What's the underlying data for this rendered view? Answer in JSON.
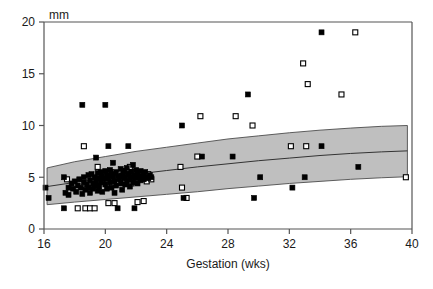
{
  "chart_data": {
    "type": "scatter",
    "title": "",
    "xlabel": "Gestation (wks)",
    "ylabel": "mm",
    "unit_label": "mm",
    "xlim": [
      16,
      40
    ],
    "ylim": [
      0,
      20
    ],
    "xticks": [
      16,
      20,
      24,
      28,
      32,
      36,
      40
    ],
    "yticks": [
      0,
      5,
      10,
      15,
      20
    ],
    "grid": false,
    "legend": "none",
    "colors": {
      "filled_marker": "#000000",
      "open_marker_fill": "#ffffff",
      "open_marker_edge": "#000000",
      "band_fill": "#bfbfbf",
      "band_edge": "#4d4d4d",
      "center_line": "#333333",
      "axis": "#555555",
      "text": "#1a1a1a"
    },
    "reference_band": {
      "description": "Shaded normal reference range with central median line",
      "x": [
        16.2,
        18,
        20,
        22,
        24,
        26,
        28,
        30,
        32,
        34,
        36,
        38,
        39.7
      ],
      "upper": [
        5.9,
        6.5,
        7.0,
        7.5,
        7.9,
        8.3,
        8.7,
        9.0,
        9.3,
        9.55,
        9.75,
        9.92,
        10.0
      ],
      "median": [
        4.1,
        4.5,
        4.9,
        5.3,
        5.65,
        6.0,
        6.3,
        6.6,
        6.85,
        7.1,
        7.3,
        7.45,
        7.55
      ],
      "lower": [
        2.35,
        2.6,
        2.85,
        3.1,
        3.35,
        3.6,
        3.9,
        4.15,
        4.4,
        4.6,
        4.8,
        4.95,
        5.05
      ]
    },
    "series": [
      {
        "name": "filled-squares",
        "marker": "filled-square",
        "points": [
          [
            16.1,
            4.0
          ],
          [
            16.3,
            3.0
          ],
          [
            17.3,
            2.0
          ],
          [
            17.3,
            5.0
          ],
          [
            17.4,
            3.5
          ],
          [
            17.6,
            4.0
          ],
          [
            17.6,
            3.3
          ],
          [
            17.8,
            4.4
          ],
          [
            17.9,
            3.9
          ],
          [
            18.0,
            4.6
          ],
          [
            18.1,
            3.6
          ],
          [
            18.2,
            4.2
          ],
          [
            18.3,
            4.8
          ],
          [
            18.4,
            4.0
          ],
          [
            18.5,
            12.0
          ],
          [
            18.5,
            3.4
          ],
          [
            18.6,
            4.5
          ],
          [
            18.6,
            5.0
          ],
          [
            18.7,
            3.8
          ],
          [
            18.8,
            4.3
          ],
          [
            18.9,
            5.2
          ],
          [
            18.9,
            4.0
          ],
          [
            19.0,
            4.7
          ],
          [
            19.0,
            3.5
          ],
          [
            19.1,
            5.3
          ],
          [
            19.2,
            4.4
          ],
          [
            19.2,
            3.9
          ],
          [
            19.3,
            5.0
          ],
          [
            19.3,
            4.2
          ],
          [
            19.4,
            6.9
          ],
          [
            19.4,
            4.6
          ],
          [
            19.5,
            5.4
          ],
          [
            19.5,
            3.7
          ],
          [
            19.6,
            4.9
          ],
          [
            19.6,
            4.1
          ],
          [
            19.7,
            5.5
          ],
          [
            19.7,
            4.5
          ],
          [
            19.8,
            5.1
          ],
          [
            19.8,
            3.6
          ],
          [
            19.9,
            4.8
          ],
          [
            20.0,
            12.0
          ],
          [
            20.0,
            5.6
          ],
          [
            20.0,
            4.3
          ],
          [
            20.1,
            5.2
          ],
          [
            20.1,
            3.9
          ],
          [
            20.2,
            8.0
          ],
          [
            20.2,
            4.9
          ],
          [
            20.3,
            5.7
          ],
          [
            20.3,
            4.5
          ],
          [
            20.4,
            5.3
          ],
          [
            20.4,
            4.0
          ],
          [
            20.5,
            6.4
          ],
          [
            20.5,
            5.0
          ],
          [
            20.6,
            4.6
          ],
          [
            20.6,
            3.5
          ],
          [
            20.7,
            5.5
          ],
          [
            20.7,
            4.2
          ],
          [
            20.8,
            5.1
          ],
          [
            20.8,
            2.0
          ],
          [
            20.9,
            4.8
          ],
          [
            21.0,
            5.8
          ],
          [
            21.0,
            4.4
          ],
          [
            21.1,
            5.2
          ],
          [
            21.1,
            3.8
          ],
          [
            21.2,
            5.6
          ],
          [
            21.2,
            4.9
          ],
          [
            21.3,
            5.0
          ],
          [
            21.3,
            4.3
          ],
          [
            21.4,
            5.9
          ],
          [
            21.4,
            4.6
          ],
          [
            21.5,
            8.0
          ],
          [
            21.5,
            5.3
          ],
          [
            21.6,
            4.8
          ],
          [
            21.6,
            4.1
          ],
          [
            21.7,
            5.5
          ],
          [
            21.7,
            5.0
          ],
          [
            21.8,
            6.2
          ],
          [
            21.8,
            4.5
          ],
          [
            21.9,
            5.2
          ],
          [
            21.9,
            2.0
          ],
          [
            22.0,
            5.7
          ],
          [
            22.0,
            4.9
          ],
          [
            22.1,
            5.4
          ],
          [
            22.1,
            4.4
          ],
          [
            22.2,
            5.0
          ],
          [
            22.3,
            5.6
          ],
          [
            22.3,
            4.7
          ],
          [
            22.4,
            5.1
          ],
          [
            22.5,
            5.3
          ],
          [
            22.5,
            4.8
          ],
          [
            22.6,
            5.5
          ],
          [
            22.7,
            5.0
          ],
          [
            22.8,
            4.9
          ],
          [
            22.9,
            5.2
          ],
          [
            23.0,
            5.0
          ],
          [
            25.0,
            10.0
          ],
          [
            25.1,
            3.0
          ],
          [
            26.3,
            7.0
          ],
          [
            28.3,
            7.0
          ],
          [
            29.3,
            13.0
          ],
          [
            29.7,
            3.0
          ],
          [
            30.1,
            5.0
          ],
          [
            32.2,
            4.0
          ],
          [
            33.0,
            5.0
          ],
          [
            34.1,
            19.0
          ],
          [
            34.1,
            8.0
          ],
          [
            36.5,
            6.0
          ]
        ]
      },
      {
        "name": "open-squares",
        "marker": "open-square",
        "points": [
          [
            17.5,
            4.8
          ],
          [
            18.2,
            2.0
          ],
          [
            18.6,
            8.0
          ],
          [
            18.7,
            2.0
          ],
          [
            19.0,
            2.0
          ],
          [
            19.3,
            2.0
          ],
          [
            19.5,
            6.0
          ],
          [
            19.6,
            4.6
          ],
          [
            19.8,
            5.0
          ],
          [
            20.0,
            5.3
          ],
          [
            20.1,
            4.4
          ],
          [
            20.2,
            2.5
          ],
          [
            20.3,
            5.5
          ],
          [
            20.4,
            4.8
          ],
          [
            20.5,
            5.2
          ],
          [
            20.6,
            2.5
          ],
          [
            20.7,
            5.0
          ],
          [
            20.8,
            4.5
          ],
          [
            20.9,
            5.4
          ],
          [
            21.0,
            4.9
          ],
          [
            21.1,
            5.1
          ],
          [
            21.2,
            5.6
          ],
          [
            21.3,
            4.7
          ],
          [
            21.4,
            5.0
          ],
          [
            21.5,
            5.3
          ],
          [
            21.6,
            6.0
          ],
          [
            21.7,
            4.4
          ],
          [
            21.8,
            5.2
          ],
          [
            21.9,
            5.5
          ],
          [
            22.0,
            4.8
          ],
          [
            22.1,
            2.6
          ],
          [
            22.2,
            5.1
          ],
          [
            22.3,
            5.4
          ],
          [
            22.4,
            4.9
          ],
          [
            22.5,
            2.7
          ],
          [
            22.6,
            5.0
          ],
          [
            22.7,
            4.6
          ],
          [
            22.8,
            5.3
          ],
          [
            23.0,
            4.8
          ],
          [
            24.9,
            6.0
          ],
          [
            25.0,
            4.0
          ],
          [
            25.3,
            3.0
          ],
          [
            26.0,
            7.0
          ],
          [
            26.2,
            10.9
          ],
          [
            28.5,
            10.9
          ],
          [
            29.6,
            10.0
          ],
          [
            32.1,
            8.0
          ],
          [
            32.9,
            16.0
          ],
          [
            33.1,
            8.0
          ],
          [
            33.2,
            14.0
          ],
          [
            35.4,
            13.0
          ],
          [
            36.3,
            19.0
          ],
          [
            39.6,
            5.0
          ]
        ]
      }
    ]
  },
  "axes": {
    "x_tick_labels": [
      "16",
      "20",
      "24",
      "28",
      "32",
      "36",
      "40"
    ],
    "y_tick_labels": [
      "0",
      "5",
      "10",
      "15",
      "20"
    ],
    "x_axis_title": "Gestation (wks)",
    "y_unit_label": "mm"
  }
}
